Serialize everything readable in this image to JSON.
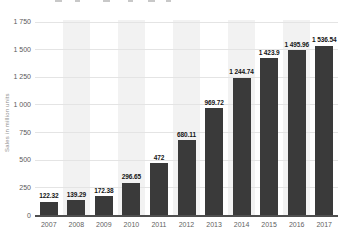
{
  "chart": {
    "y_axis_title": "Sales in million units"
  },
  "chart_data": {
    "type": "bar",
    "title": "",
    "categories": [
      "2007",
      "2008",
      "2009",
      "2010",
      "2011",
      "2012",
      "2013",
      "2014",
      "2015",
      "2016",
      "2017"
    ],
    "values": [
      122.32,
      139.29,
      172.38,
      296.65,
      472,
      680.11,
      969.72,
      1244.74,
      1423.9,
      1495.96,
      1536.54
    ],
    "value_labels": [
      "122.32",
      "139.29",
      "172.38",
      "296.65",
      "472",
      "680.11",
      "969.72",
      "1 244.74",
      "1 423.9",
      "1 495.96",
      "1 536.54"
    ],
    "xlabel": "",
    "ylabel": "Sales in million units",
    "ylim": [
      0,
      1750
    ],
    "y_ticks": [
      {
        "value": 1750,
        "label": "1 750"
      },
      {
        "value": 1500,
        "label": "1 500"
      },
      {
        "value": 1250,
        "label": "1 250"
      },
      {
        "value": 1000,
        "label": "1 000"
      },
      {
        "value": 750,
        "label": "750"
      },
      {
        "value": 500,
        "label": "500"
      },
      {
        "value": 250,
        "label": "250"
      },
      {
        "value": 0,
        "label": "0"
      }
    ],
    "grid": true,
    "legend": false,
    "band_pattern": "alternating-columns",
    "colors": {
      "bar": "#3a3a3a",
      "column_band": "#f2f2f2",
      "gridline": "#e4e4e4",
      "axis_line": "#4f4f4f",
      "tick_text": "#595959",
      "value_text": "#141414"
    }
  }
}
